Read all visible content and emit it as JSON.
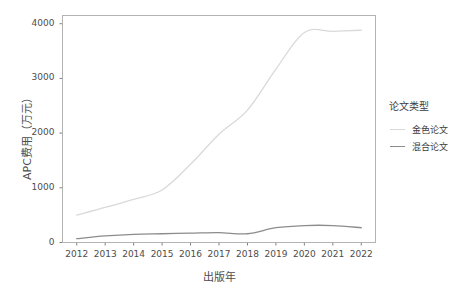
{
  "chart_data": {
    "type": "line",
    "title": "",
    "xlabel": "出版年",
    "ylabel": "APC费用（万元）",
    "x": [
      2012,
      2013,
      2014,
      2015,
      2016,
      2017,
      2018,
      2019,
      2020,
      2021,
      2022
    ],
    "categories": [
      "2012",
      "2013",
      "2014",
      "2015",
      "2016",
      "2017",
      "2018",
      "2019",
      "2020",
      "2021",
      "2022"
    ],
    "series": [
      {
        "name": "金色论文",
        "color": "#d9d9d9",
        "values": [
          500,
          640,
          790,
          960,
          1430,
          1980,
          2420,
          3170,
          3840,
          3860,
          3880
        ]
      },
      {
        "name": "混合论文",
        "color": "#8c8c8c",
        "values": [
          70,
          120,
          150,
          160,
          170,
          180,
          160,
          270,
          310,
          310,
          270
        ]
      }
    ],
    "xlim": [
      2011.5,
      2022.5
    ],
    "ylim": [
      0,
      4150
    ],
    "yticks": [
      0,
      1000,
      2000,
      3000,
      4000
    ],
    "ytick_labels": [
      "0",
      "1000",
      "2000",
      "3000",
      "4000"
    ],
    "xticks": [
      2012,
      2013,
      2014,
      2015,
      2016,
      2017,
      2018,
      2019,
      2020,
      2021,
      2022
    ],
    "grid": false,
    "legend_position": "right"
  },
  "legend": {
    "title": "论文类型",
    "items": [
      {
        "label": "金色论文",
        "color": "#d9d9d9"
      },
      {
        "label": "混合论文",
        "color": "#8c8c8c"
      }
    ]
  },
  "axes": {
    "panel_border_color": "#b3b3b3",
    "tick_color": "#7f7f7f",
    "text_color": "#4d4d4d"
  }
}
